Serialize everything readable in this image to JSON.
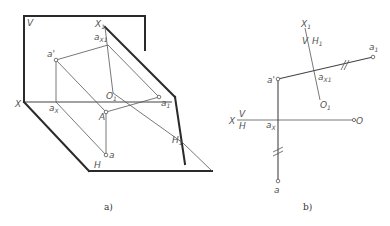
{
  "figure_a": {
    "caption": "a)",
    "labels": {
      "V": "V",
      "X": "X",
      "H": "H",
      "X1": "X",
      "X1_sub": "1",
      "ax1": "a",
      "ax1_sub": "X1",
      "a_prime": "a'",
      "ax": "a",
      "ax_sub": "X",
      "O1": "O",
      "O1_sub": "1",
      "a1": "a",
      "a1_sub": "1",
      "A": "A",
      "a": "a",
      "H1": "H",
      "H1_sub": "1"
    }
  },
  "figure_b": {
    "caption": "b)",
    "labels": {
      "X1": "X",
      "X1_sub": "1",
      "V": "V",
      "H1": "H",
      "H1_sub": "1",
      "a1": "a",
      "a1_sub": "1",
      "a_prime": "a'",
      "ax1": "a",
      "ax1_sub": "X1",
      "O1": "O",
      "O1_sub": "1",
      "X": "X",
      "V_lower": "V",
      "H_lower": "H",
      "ax": "a",
      "ax_sub": "X",
      "O": "O",
      "a": "a"
    }
  },
  "colors": {
    "thick_line": "#2a2a2a",
    "thin_line": "#555555",
    "label": "#555555",
    "background": "#ffffff"
  }
}
